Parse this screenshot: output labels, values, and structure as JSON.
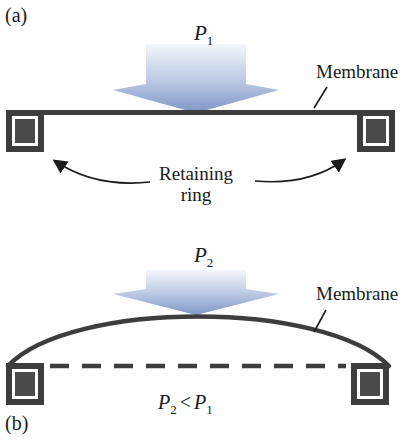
{
  "figure": {
    "panel_a": {
      "tag": "(a)",
      "pressure": {
        "base": "P",
        "sub": "1"
      },
      "membrane_label": "Membrane",
      "retaining_line1": "Retaining",
      "retaining_line2": "ring"
    },
    "panel_b": {
      "tag": "(b)",
      "pressure": {
        "base": "P",
        "sub": "2"
      },
      "membrane_label": "Membrane",
      "inequality": {
        "lhs_base": "P",
        "lhs_sub": "2",
        "operator": "<",
        "rhs_base": "P",
        "rhs_sub": "1"
      }
    }
  },
  "colors": {
    "background": "#fefefe",
    "text": "#1a1a1a",
    "ink": "#3d3d3d",
    "inner_square": "#4a4a4a",
    "ring_gap": "#ffffff",
    "arrow_top": "#f4f7fb",
    "arrow_mid": "#b9c7e2",
    "arrow_bottom": "#7e97c8"
  }
}
